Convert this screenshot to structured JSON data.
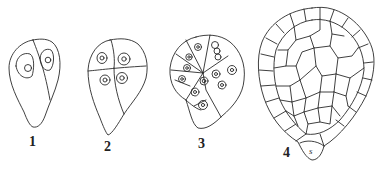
{
  "figure": {
    "panels": [
      {
        "label": "1",
        "description": "two-celled stage with nuclei"
      },
      {
        "label": "2",
        "description": "four-celled stage (quadrant)"
      },
      {
        "label": "3",
        "description": "multicellular stage with nuclei"
      },
      {
        "label": "4",
        "description": "globular embryo with suspensor cell"
      }
    ],
    "suspensor_label": "s"
  },
  "colors": {
    "line": "#2a2a2a",
    "background": "#ffffff"
  }
}
